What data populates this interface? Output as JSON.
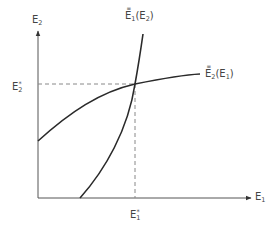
{
  "diagram": {
    "type": "reaction-function-equilibrium",
    "axes": {
      "x_label_base": "E",
      "x_label_sub": "1",
      "y_label_base": "E",
      "y_label_sub": "2"
    },
    "equilibrium": {
      "x_label_base": "E",
      "x_label_sub": "1",
      "x_label_sup": "*",
      "y_label_base": "E",
      "y_label_sub": "2",
      "y_label_sup": "*"
    },
    "curves": [
      {
        "name": "E1 reaction function",
        "label_base": "E",
        "label_sub": "1",
        "label_arg_open": "(E",
        "label_arg_sub": "2",
        "label_arg_close": ")",
        "shape": "convex, steep"
      },
      {
        "name": "E2 reaction function",
        "label_base": "E",
        "label_sub": "2",
        "label_arg_open": "(E",
        "label_arg_sub": "1",
        "label_arg_close": ")",
        "shape": "concave"
      }
    ],
    "colors": {
      "curve": "#2a2a2a",
      "axis": "#555555",
      "dashed": "#888888"
    }
  }
}
